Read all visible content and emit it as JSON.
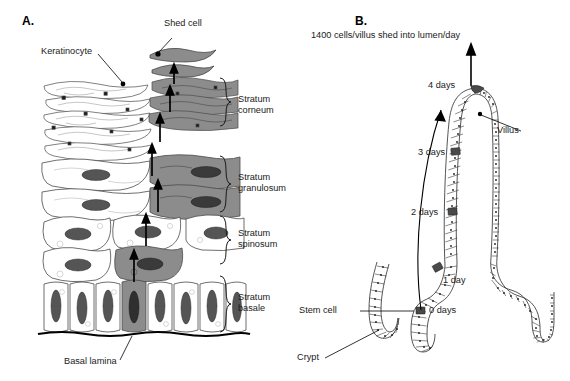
{
  "figure": {
    "panels": [
      {
        "letter": "A.",
        "name": "epidermis-keratinocyte-diagram",
        "labels": {
          "shed_cell": "Shed cell",
          "keratinocyte": "Keratinocyte",
          "basal_lamina": "Basal lamina"
        },
        "layers": [
          {
            "line1": "Stratum",
            "line2": "corneum"
          },
          {
            "line1": "Stratum",
            "line2": "granulosum"
          },
          {
            "line1": "Stratum",
            "line2": "spinosum"
          },
          {
            "line1": "Stratum",
            "line2": "basale"
          }
        ]
      },
      {
        "letter": "B.",
        "name": "intestinal-villus-crypt-diagram",
        "caption": "1400 cells/villus shed into lumen/day",
        "labels": {
          "villus": "Villus",
          "stem_cell": "Stem cell",
          "crypt": "Crypt"
        },
        "timepoints": [
          {
            "label": "4 days"
          },
          {
            "label": "3 days"
          },
          {
            "label": "2 days"
          },
          {
            "label": "1 day"
          },
          {
            "label": "0 days"
          }
        ]
      }
    ]
  },
  "colors": {
    "ink": "#000000",
    "text": "#1a1a1a",
    "cell_fill_light": "#ffffff",
    "cell_shaded_mid": "#8c8c8c",
    "cell_shaded_dark": "#6e6e6e",
    "cell_outline": "#3a3a3a",
    "marker_dark": "#4a4a4a"
  }
}
